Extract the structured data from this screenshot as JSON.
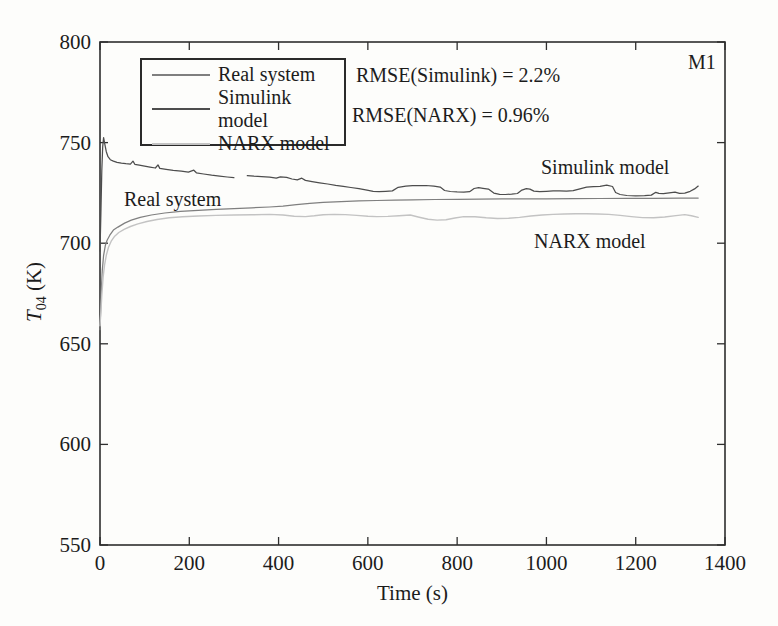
{
  "figure": {
    "background": "#fdfdfb",
    "frame_color": "#2e2e2e",
    "text_color": "#1c1c1c"
  },
  "texts": {
    "rmse_simulink": "RMSE(Simulink) = 2.2%",
    "rmse_narx": "RMSE(NARX) = 0.96%",
    "corner_label": "M1",
    "annotation_real": "Real system",
    "annotation_simulink": "Simulink model",
    "annotation_narx": "NARX model"
  },
  "chart_data": {
    "type": "line",
    "title": "",
    "xlabel": "Time (s)",
    "ylabel_var": "T",
    "ylabel_sub": "04",
    "ylabel_unit": " (K)",
    "ylabel_display": "T04 (K)",
    "xlim": [
      0,
      1400
    ],
    "ylim": [
      550,
      800
    ],
    "xticks": [
      0,
      200,
      400,
      600,
      800,
      1000,
      1200,
      1400
    ],
    "yticks": [
      550,
      600,
      650,
      700,
      750,
      800
    ],
    "grid": false,
    "box": true,
    "tick_direction": "in",
    "legend_position": "top-left",
    "series": [
      {
        "name": "Real system",
        "color": "#7f7f7f",
        "width": 1.25,
        "segments": [
          [
            [
              0,
              657
            ],
            [
              1,
              663
            ],
            [
              3,
              676
            ],
            [
              5,
              686
            ],
            [
              8,
              694
            ],
            [
              12,
              699
            ],
            [
              16,
              701.5
            ],
            [
              22,
              704
            ],
            [
              30,
              706.5
            ],
            [
              40,
              708
            ],
            [
              55,
              710
            ],
            [
              70,
              711.5
            ],
            [
              90,
              712.8
            ],
            [
              115,
              714
            ],
            [
              145,
              715
            ],
            [
              180,
              715.8
            ],
            [
              220,
              716.3
            ],
            [
              260,
              716.8
            ],
            [
              300,
              717.2
            ],
            [
              340,
              717.6
            ],
            [
              380,
              718
            ],
            [
              410,
              718.4
            ],
            [
              440,
              719.2
            ],
            [
              470,
              719.8
            ],
            [
              500,
              720.3
            ],
            [
              540,
              720.7
            ],
            [
              580,
              721
            ],
            [
              620,
              721.2
            ],
            [
              660,
              721.4
            ],
            [
              700,
              721.5
            ],
            [
              750,
              721.7
            ],
            [
              800,
              721.8
            ],
            [
              850,
              721.9
            ],
            [
              900,
              722
            ],
            [
              950,
              722
            ],
            [
              1000,
              722
            ],
            [
              1060,
              722.1
            ],
            [
              1120,
              722.2
            ],
            [
              1180,
              722.3
            ],
            [
              1240,
              722.3
            ],
            [
              1300,
              722.4
            ],
            [
              1340,
              722.4
            ]
          ]
        ]
      },
      {
        "name": "Simulink model",
        "color": "#4d4d4d",
        "width": 1.25,
        "segments": [
          [
            [
              0,
              696
            ],
            [
              2,
              715
            ],
            [
              4,
              736
            ],
            [
              6,
              748
            ],
            [
              8,
              752.5
            ],
            [
              11,
              749
            ],
            [
              14,
              745.5
            ],
            [
              18,
              743
            ],
            [
              23,
              741.5
            ],
            [
              30,
              740.8
            ],
            [
              38,
              740.2
            ],
            [
              48,
              739.8
            ],
            [
              58,
              739.5
            ],
            [
              68,
              739.3
            ],
            [
              74,
              740.8
            ],
            [
              78,
              739.2
            ],
            [
              88,
              738.8
            ],
            [
              100,
              738.3
            ],
            [
              112,
              737.8
            ],
            [
              124,
              737.4
            ],
            [
              130,
              738.9
            ],
            [
              134,
              737.2
            ],
            [
              148,
              736.7
            ],
            [
              164,
              736.2
            ],
            [
              182,
              735.8
            ],
            [
              198,
              735.3
            ],
            [
              210,
              736.3
            ],
            [
              216,
              735
            ],
            [
              232,
              734.4
            ],
            [
              250,
              733.8
            ],
            [
              268,
              733.3
            ],
            [
              285,
              732.9
            ],
            [
              300,
              732.6
            ]
          ],
          [
            [
              330,
              733.6
            ],
            [
              345,
              733.3
            ],
            [
              362,
              733.1
            ],
            [
              380,
              732.8
            ],
            [
              395,
              732.3
            ],
            [
              404,
              733
            ],
            [
              418,
              732.7
            ],
            [
              430,
              731.9
            ],
            [
              442,
              731.5
            ],
            [
              452,
              732.3
            ],
            [
              460,
              731.2
            ],
            [
              475,
              730.6
            ],
            [
              492,
              730
            ],
            [
              510,
              729.4
            ],
            [
              528,
              728.8
            ],
            [
              545,
              728.3
            ],
            [
              562,
              727.7
            ],
            [
              580,
              727.1
            ],
            [
              598,
              726.4
            ],
            [
              612,
              725.8
            ],
            [
              625,
              725.6
            ],
            [
              640,
              725.8
            ],
            [
              655,
              726
            ],
            [
              668,
              727.8
            ],
            [
              685,
              728.4
            ],
            [
              700,
              728.6
            ],
            [
              715,
              728.6
            ],
            [
              730,
              728.7
            ],
            [
              748,
              728.4
            ],
            [
              762,
              727.9
            ],
            [
              772,
              726.2
            ],
            [
              785,
              725.7
            ],
            [
              800,
              725.5
            ],
            [
              815,
              725.4
            ],
            [
              828,
              725.6
            ],
            [
              838,
              727.2
            ],
            [
              848,
              727.6
            ],
            [
              858,
              727.3
            ],
            [
              870,
              726.9
            ],
            [
              882,
              724.9
            ],
            [
              895,
              724.3
            ],
            [
              908,
              724.2
            ],
            [
              922,
              724.4
            ],
            [
              935,
              724.7
            ],
            [
              945,
              726.4
            ],
            [
              955,
              727.1
            ],
            [
              963,
              726.9
            ],
            [
              972,
              725.9
            ],
            [
              985,
              725.6
            ],
            [
              1000,
              725.8
            ],
            [
              1015,
              726
            ],
            [
              1030,
              726
            ],
            [
              1045,
              725.9
            ],
            [
              1060,
              726.1
            ],
            [
              1075,
              727
            ],
            [
              1090,
              727.9
            ],
            [
              1105,
              728.1
            ],
            [
              1120,
              728.3
            ],
            [
              1135,
              728.9
            ],
            [
              1148,
              728.2
            ],
            [
              1155,
              725.2
            ],
            [
              1165,
              724.2
            ],
            [
              1180,
              723.7
            ],
            [
              1200,
              723.5
            ],
            [
              1220,
              723.6
            ],
            [
              1235,
              723.9
            ],
            [
              1245,
              725.3
            ],
            [
              1252,
              724.8
            ],
            [
              1262,
              724.6
            ],
            [
              1275,
              725
            ],
            [
              1288,
              725.4
            ],
            [
              1298,
              724.8
            ],
            [
              1310,
              724.9
            ],
            [
              1322,
              725.8
            ],
            [
              1332,
              727
            ],
            [
              1340,
              728.4
            ]
          ]
        ]
      },
      {
        "name": "NARX model",
        "color": "#c3c3c3",
        "width": 1.4,
        "segments": [
          [
            [
              0,
              659
            ],
            [
              2,
              666
            ],
            [
              4,
              674
            ],
            [
              7,
              683
            ],
            [
              10,
              689
            ],
            [
              14,
              694
            ],
            [
              19,
              698
            ],
            [
              25,
              701
            ],
            [
              33,
              703.5
            ],
            [
              42,
              705.3
            ],
            [
              54,
              706.9
            ],
            [
              68,
              708.3
            ],
            [
              85,
              709.6
            ],
            [
              105,
              710.8
            ],
            [
              128,
              711.8
            ],
            [
              155,
              712.6
            ],
            [
              185,
              713.1
            ],
            [
              220,
              713.5
            ],
            [
              260,
              713.8
            ],
            [
              300,
              714
            ],
            [
              340,
              714.1
            ],
            [
              380,
              714.3
            ],
            [
              410,
              714
            ],
            [
              435,
              713.4
            ],
            [
              460,
              713.2
            ],
            [
              480,
              713.6
            ],
            [
              500,
              714.1
            ],
            [
              525,
              714.3
            ],
            [
              550,
              714.2
            ],
            [
              575,
              713.8
            ],
            [
              600,
              713.4
            ],
            [
              620,
              713.2
            ],
            [
              645,
              713.3
            ],
            [
              670,
              713.6
            ],
            [
              695,
              714
            ],
            [
              715,
              712.9
            ],
            [
              735,
              711.9
            ],
            [
              755,
              711.5
            ],
            [
              775,
              711.7
            ],
            [
              795,
              712.5
            ],
            [
              815,
              713.2
            ],
            [
              840,
              713.1
            ],
            [
              865,
              712.6
            ],
            [
              890,
              712.3
            ],
            [
              915,
              712.4
            ],
            [
              940,
              712.8
            ],
            [
              965,
              713.5
            ],
            [
              990,
              714
            ],
            [
              1015,
              714.3
            ],
            [
              1040,
              714.5
            ],
            [
              1065,
              714.6
            ],
            [
              1090,
              714.6
            ],
            [
              1115,
              714.5
            ],
            [
              1140,
              714.3
            ],
            [
              1165,
              713.8
            ],
            [
              1190,
              713.2
            ],
            [
              1215,
              712.7
            ],
            [
              1240,
              712.6
            ],
            [
              1265,
              713
            ],
            [
              1290,
              713.7
            ],
            [
              1310,
              714.2
            ],
            [
              1325,
              713.6
            ],
            [
              1340,
              712.8
            ]
          ]
        ]
      }
    ]
  }
}
